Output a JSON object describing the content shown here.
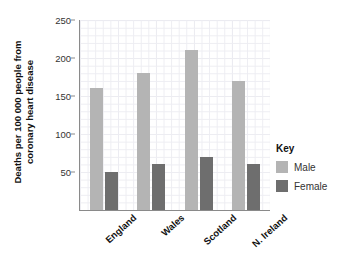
{
  "chart_data": {
    "type": "bar",
    "title": "",
    "subtitle": "",
    "xlabel": "",
    "ylabel": "Deaths per 100 000 people from coronary heart disease",
    "ylabel_lines": [
      "Deaths per 100 000 people from",
      "coronary heart disease"
    ],
    "categories": [
      "England",
      "Wales",
      "Scotland",
      "N. Ireland"
    ],
    "series": [
      {
        "name": "Male",
        "values": [
          160,
          180,
          210,
          170
        ],
        "color": "#b4b4b4"
      },
      {
        "name": "Female",
        "values": [
          50,
          60,
          70,
          60
        ],
        "color": "#6e6e6e"
      }
    ],
    "ylim": [
      0,
      250
    ],
    "ytick_values": [
      0,
      50,
      100,
      150,
      200,
      250
    ],
    "ytick_labels": [
      "",
      "50",
      "100",
      "150",
      "200",
      "250"
    ],
    "ytick_interval": 50,
    "grid": true,
    "grid_minor": true,
    "grid_color": "#e2e2ea",
    "legend_position": "right",
    "legend_title": "Key",
    "legend_entries": [
      "Male",
      "Female"
    ],
    "background": "#ffffff",
    "axis_color": "#8a8a8a"
  },
  "legend": {
    "title": "Key",
    "items": [
      {
        "label": "Male",
        "color": "#b4b4b4"
      },
      {
        "label": "Female",
        "color": "#6e6e6e"
      }
    ]
  },
  "axes": {
    "y_title_line1": "Deaths per 100 000 people from",
    "y_title_line2": "coronary heart disease",
    "y_ticks": [
      {
        "label": "250",
        "value": 250
      },
      {
        "label": "200",
        "value": 200
      },
      {
        "label": "150",
        "value": 150
      },
      {
        "label": "100",
        "value": 100
      },
      {
        "label": "50",
        "value": 50
      }
    ],
    "x_categories": [
      "England",
      "Wales",
      "Scotland",
      "N. Ireland"
    ]
  }
}
